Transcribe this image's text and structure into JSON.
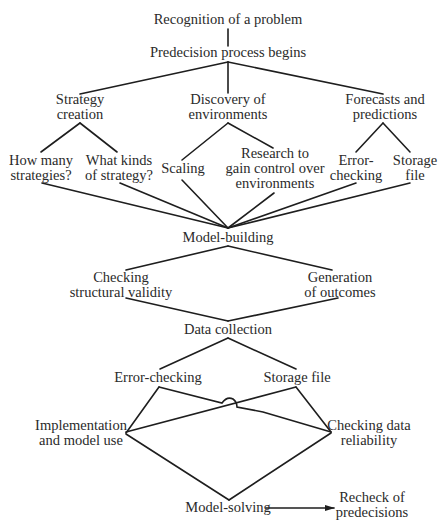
{
  "diagram": {
    "type": "decision-process-flow",
    "nodes": {
      "recognition": {
        "lines": [
          "Recognition of a problem"
        ],
        "x": 228,
        "y": [
          24
        ]
      },
      "predecision": {
        "lines": [
          "Predecision process begins"
        ],
        "x": 228,
        "y": [
          57
        ]
      },
      "strategy": {
        "lines": [
          "Strategy",
          "creation"
        ],
        "x": 80,
        "y": [
          104,
          119
        ]
      },
      "discovery": {
        "lines": [
          "Discovery of",
          "environments"
        ],
        "x": 228,
        "y": [
          104,
          119
        ]
      },
      "forecasts": {
        "lines": [
          "Forecasts and",
          "predictions"
        ],
        "x": 385,
        "y": [
          104,
          119
        ]
      },
      "how_many": {
        "lines": [
          "How many",
          "strategies?"
        ],
        "x": 41,
        "y": [
          165,
          180
        ]
      },
      "what_kinds": {
        "lines": [
          "What kinds",
          "of strategy?"
        ],
        "x": 119,
        "y": [
          165,
          180
        ]
      },
      "scaling": {
        "lines": [
          "Scaling"
        ],
        "x": 183,
        "y": [
          173
        ]
      },
      "research": {
        "lines": [
          "Research to",
          "gain control over",
          "environments"
        ],
        "x": 275,
        "y": [
          158,
          173,
          188
        ]
      },
      "fc_error": {
        "lines": [
          "Error-",
          "checking"
        ],
        "x": 356,
        "y": [
          165,
          180
        ]
      },
      "fc_storage": {
        "lines": [
          "Storage",
          "file"
        ],
        "x": 415,
        "y": [
          165,
          180
        ]
      },
      "model_building": {
        "lines": [
          "Model-building"
        ],
        "x": 228,
        "y": [
          242
        ]
      },
      "checking_structural": {
        "lines": [
          "Checking",
          "structural validity"
        ],
        "x": 121,
        "y": [
          282,
          297
        ]
      },
      "generation": {
        "lines": [
          "Generation",
          "of outcomes"
        ],
        "x": 340,
        "y": [
          282,
          297
        ]
      },
      "data_collection": {
        "lines": [
          "Data collection"
        ],
        "x": 228,
        "y": [
          334
        ]
      },
      "dc_error": {
        "lines": [
          "Error-checking"
        ],
        "x": 158,
        "y": [
          382
        ]
      },
      "dc_storage": {
        "lines": [
          "Storage file"
        ],
        "x": 297,
        "y": [
          382
        ]
      },
      "implementation": {
        "lines": [
          "Implementation",
          "and model use"
        ],
        "x": 81,
        "y": [
          430,
          445
        ]
      },
      "checking_data": {
        "lines": [
          "Checking data",
          "reliability"
        ],
        "x": 369,
        "y": [
          430,
          445
        ]
      },
      "model_solving": {
        "lines": [
          "Model-solving"
        ],
        "x": 228,
        "y": [
          512
        ]
      },
      "recheck": {
        "lines": [
          "Recheck of",
          "predecisions"
        ],
        "x": 372,
        "y": [
          502,
          517
        ]
      }
    },
    "edges": [
      {
        "from": "recognition",
        "to": "predecision",
        "pts": [
          [
            228,
            29
          ],
          [
            228,
            46
          ]
        ]
      },
      {
        "from": "predecision",
        "to": "strategy",
        "pts": [
          [
            228,
            62
          ],
          [
            80,
            94
          ]
        ]
      },
      {
        "from": "predecision",
        "to": "discovery",
        "pts": [
          [
            228,
            62
          ],
          [
            228,
            93
          ]
        ]
      },
      {
        "from": "predecision",
        "to": "forecasts",
        "pts": [
          [
            228,
            62
          ],
          [
            383,
            94
          ]
        ]
      },
      {
        "from": "strategy",
        "to": "how_many",
        "pts": [
          [
            80,
            123
          ],
          [
            41,
            152
          ]
        ]
      },
      {
        "from": "strategy",
        "to": "what_kinds",
        "pts": [
          [
            80,
            123
          ],
          [
            117,
            152
          ]
        ]
      },
      {
        "from": "discovery",
        "to": "scaling",
        "pts": [
          [
            228,
            123
          ],
          [
            182,
            160
          ]
        ]
      },
      {
        "from": "discovery",
        "to": "research",
        "pts": [
          [
            228,
            123
          ],
          [
            273,
            148
          ]
        ]
      },
      {
        "from": "forecasts",
        "to": "fc_error",
        "pts": [
          [
            383,
            123
          ],
          [
            356,
            152
          ]
        ]
      },
      {
        "from": "forecasts",
        "to": "fc_storage",
        "pts": [
          [
            383,
            123
          ],
          [
            410,
            152
          ]
        ]
      },
      {
        "from": "how_many",
        "to": "model_building",
        "pts": [
          [
            42,
            183
          ],
          [
            228,
            228
          ]
        ]
      },
      {
        "from": "what_kinds",
        "to": "model_building",
        "pts": [
          [
            120,
            183
          ],
          [
            228,
            228
          ]
        ]
      },
      {
        "from": "scaling",
        "to": "model_building",
        "pts": [
          [
            182,
            180
          ],
          [
            228,
            228
          ]
        ]
      },
      {
        "from": "research",
        "to": "model_building",
        "pts": [
          [
            274,
            193
          ],
          [
            228,
            228
          ]
        ]
      },
      {
        "from": "fc_error",
        "to": "model_building",
        "pts": [
          [
            356,
            183
          ],
          [
            228,
            228
          ]
        ]
      },
      {
        "from": "fc_storage",
        "to": "model_building",
        "pts": [
          [
            410,
            183
          ],
          [
            228,
            228
          ]
        ]
      },
      {
        "from": "model_building",
        "to": "checking_structural",
        "pts": [
          [
            228,
            246
          ],
          [
            126,
            270
          ]
        ]
      },
      {
        "from": "model_building",
        "to": "generation",
        "pts": [
          [
            228,
            246
          ],
          [
            332,
            270
          ]
        ]
      },
      {
        "from": "checking_structural",
        "to": "data_collection",
        "pts": [
          [
            126,
            298
          ],
          [
            228,
            321
          ]
        ]
      },
      {
        "from": "generation",
        "to": "data_collection",
        "pts": [
          [
            338,
            298
          ],
          [
            228,
            321
          ]
        ]
      },
      {
        "from": "data_collection",
        "to": "dc_error",
        "pts": [
          [
            228,
            338
          ],
          [
            160,
            369
          ]
        ]
      },
      {
        "from": "data_collection",
        "to": "dc_storage",
        "pts": [
          [
            228,
            338
          ],
          [
            296,
            369
          ]
        ]
      }
    ],
    "arrow": {
      "from": "model_solving",
      "to": "recheck",
      "pts": [
        [
          266,
          508
        ],
        [
          334,
          508
        ]
      ]
    }
  }
}
